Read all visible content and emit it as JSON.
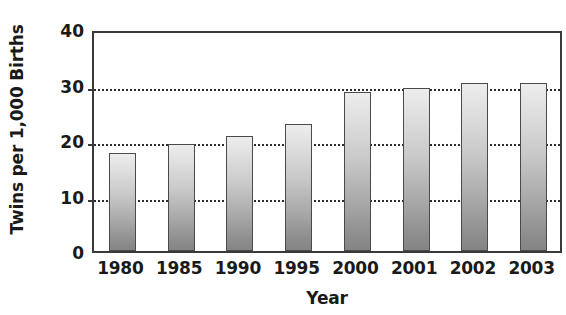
{
  "chart_data": {
    "type": "bar",
    "title": "",
    "xlabel": "Year",
    "ylabel": "Twins per 1,000 Births",
    "categories": [
      "1980",
      "1985",
      "1990",
      "1995",
      "2000",
      "2001",
      "2002",
      "2003"
    ],
    "values": [
      17.7,
      19.3,
      20.8,
      22.8,
      28.6,
      29.3,
      30.2,
      30.3
    ],
    "series": [
      {
        "name": "Twins per 1,000 Births",
        "values": [
          17.7,
          19.3,
          20.8,
          22.8,
          28.6,
          29.3,
          30.2,
          30.3
        ]
      }
    ],
    "ylim": [
      0,
      40
    ],
    "yticks": [
      0,
      10,
      20,
      30,
      40
    ],
    "ytick_labels": [
      "0",
      "10",
      "20",
      "30",
      "40"
    ],
    "gridlines": [
      10,
      20,
      30
    ],
    "grid": true,
    "legend": false,
    "legend_position": "none",
    "bar_fill_top_color": "#ededed",
    "bar_fill_bottom_color": "#858585",
    "bar_outline_color": "#4a4a4a",
    "axis_color": "#3a3a3a",
    "gridline_color": "#2b2b2b",
    "background_color": "#ffffff"
  }
}
